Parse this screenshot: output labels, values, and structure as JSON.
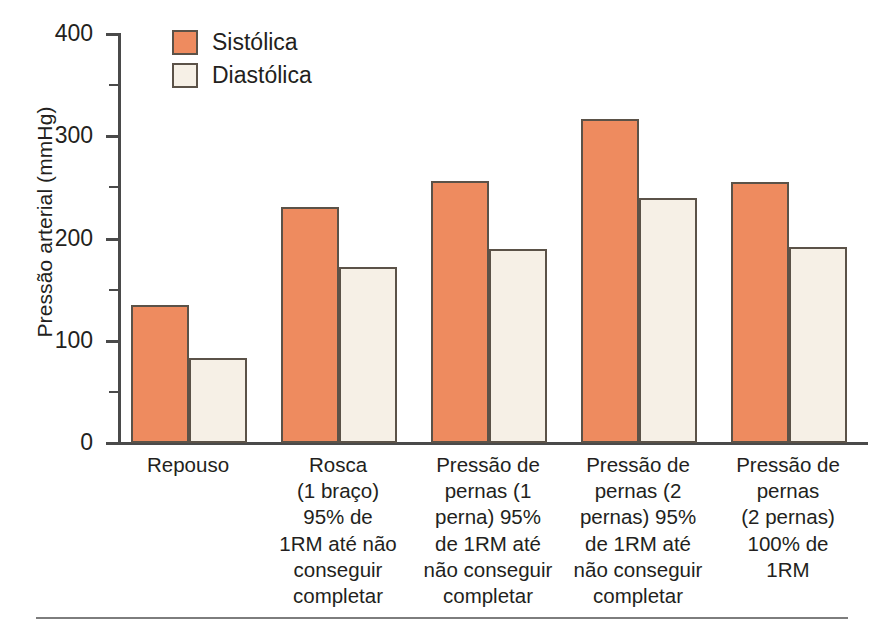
{
  "chart_data": {
    "type": "bar",
    "title": "",
    "xlabel": "",
    "ylabel": "Pressão arterial (mmHg)",
    "ylim": [
      0,
      400
    ],
    "yticks": [
      0,
      100,
      200,
      300,
      400
    ],
    "ytick_labels": [
      "0",
      "100",
      "200",
      "300",
      "400"
    ],
    "yminor_ticks": [
      50,
      150,
      250,
      350
    ],
    "grid": false,
    "legend_position": "top-left-inside",
    "categories": [
      "Repouso",
      "Rosca (1 braço) 95% de 1RM até não conseguir completar",
      "Pressão de pernas (1 perna) 95% de 1RM até não conseguir completar",
      "Pressão de pernas (2 pernas) 95% de 1RM até não conseguir completar",
      "Pressão de pernas (2 pernas) 100% de 1RM"
    ],
    "category_lines": [
      [
        "Repouso"
      ],
      [
        "Rosca",
        "(1 braço)",
        "95% de",
        "1RM até não",
        "conseguir",
        "completar"
      ],
      [
        "Pressão de",
        "pernas (1",
        "perna) 95%",
        "de 1RM até",
        "não conseguir",
        "completar"
      ],
      [
        "Pressão de",
        "pernas (2",
        "pernas) 95%",
        "de 1RM até",
        "não conseguir",
        "completar"
      ],
      [
        "Pressão de",
        "pernas",
        "(2 pernas)",
        "100% de",
        "1RM"
      ]
    ],
    "series": [
      {
        "name": "Sistólica",
        "color": "#ee8b5f",
        "values": [
          135,
          231,
          256,
          317,
          255
        ]
      },
      {
        "name": "Diastólica",
        "color": "#f6f0e6",
        "values": [
          83,
          172,
          190,
          240,
          192
        ]
      }
    ]
  },
  "legend": {
    "items": [
      {
        "label": "Sistólica",
        "color": "#ee8b5f"
      },
      {
        "label": "Diastólica",
        "color": "#f6f0e6"
      }
    ]
  },
  "axes": {
    "y_title": "Pressão arterial (mmHg)",
    "y_tick_labels": [
      "400",
      "300",
      "200",
      "100",
      "0"
    ]
  },
  "colors": {
    "systolic": "#ee8b5f",
    "diastolic": "#f6f0e6",
    "outline": "#5b5248",
    "axis": "#4a4a4a",
    "text": "#231f20",
    "rule": "#7d7d7d",
    "background": "#ffffff"
  }
}
